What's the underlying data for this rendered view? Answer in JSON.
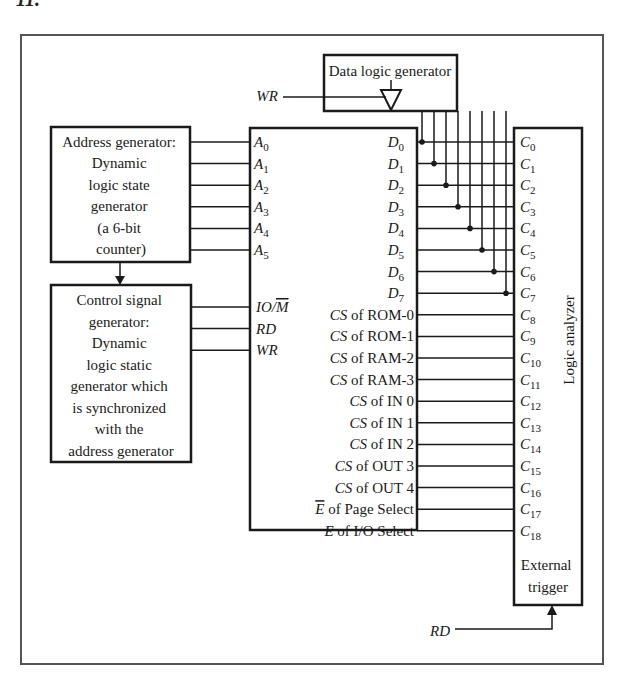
{
  "figure": {
    "label_fragment": "11.",
    "frame_color": "#555555",
    "line_color": "#1a1a1a"
  },
  "data_logic_generator": {
    "label": "Data logic generator",
    "enable_signal": "WR"
  },
  "address_generator": {
    "lines": [
      "Address generator:",
      "Dynamic",
      "logic state",
      "generator",
      "(a 6-bit",
      "counter)"
    ]
  },
  "control_signal_generator": {
    "lines": [
      "Control signal",
      "generator:",
      "Dynamic",
      "logic static",
      "generator which",
      "is synchronized",
      "with the",
      "address generator"
    ]
  },
  "central_block": {
    "address_inputs": [
      {
        "base": "A",
        "sub": "0"
      },
      {
        "base": "A",
        "sub": "1"
      },
      {
        "base": "A",
        "sub": "2"
      },
      {
        "base": "A",
        "sub": "3"
      },
      {
        "base": "A",
        "sub": "4"
      },
      {
        "base": "A",
        "sub": "5"
      }
    ],
    "control_inputs": [
      {
        "label": "IO/",
        "overbar": "M"
      },
      {
        "label": "RD",
        "overbar": ""
      },
      {
        "label": "WR",
        "overbar": ""
      }
    ],
    "data_outputs": [
      {
        "base": "D",
        "sub": "0"
      },
      {
        "base": "D",
        "sub": "1"
      },
      {
        "base": "D",
        "sub": "2"
      },
      {
        "base": "D",
        "sub": "3"
      },
      {
        "base": "D",
        "sub": "4"
      },
      {
        "base": "D",
        "sub": "5"
      },
      {
        "base": "D",
        "sub": "6"
      },
      {
        "base": "D",
        "sub": "7"
      }
    ],
    "select_outputs": [
      {
        "prefix": "CS",
        "prefix_overbar": false,
        "text": " of ROM-0"
      },
      {
        "prefix": "CS",
        "prefix_overbar": false,
        "text": " of ROM-1"
      },
      {
        "prefix": "CS",
        "prefix_overbar": false,
        "text": " of RAM-2"
      },
      {
        "prefix": "CS",
        "prefix_overbar": false,
        "text": " of RAM-3"
      },
      {
        "prefix": "CS",
        "prefix_overbar": false,
        "text": " of IN 0"
      },
      {
        "prefix": "CS",
        "prefix_overbar": false,
        "text": " of IN 1"
      },
      {
        "prefix": "CS",
        "prefix_overbar": false,
        "text": " of IN 2"
      },
      {
        "prefix": "CS",
        "prefix_overbar": false,
        "text": " of OUT 3"
      },
      {
        "prefix": "CS",
        "prefix_overbar": false,
        "text": " of OUT 4"
      },
      {
        "prefix": "E",
        "prefix_overbar": true,
        "text": " of Page Select"
      },
      {
        "prefix": "E",
        "prefix_overbar": false,
        "text": " of I/O Select"
      }
    ]
  },
  "logic_analyzer": {
    "title": "Logic analyzer",
    "channels": [
      {
        "base": "C",
        "sub": "0"
      },
      {
        "base": "C",
        "sub": "1"
      },
      {
        "base": "C",
        "sub": "2"
      },
      {
        "base": "C",
        "sub": "3"
      },
      {
        "base": "C",
        "sub": "4"
      },
      {
        "base": "C",
        "sub": "5"
      },
      {
        "base": "C",
        "sub": "6"
      },
      {
        "base": "C",
        "sub": "7"
      },
      {
        "base": "C",
        "sub": "8"
      },
      {
        "base": "C",
        "sub": "9"
      },
      {
        "base": "C",
        "sub": "10"
      },
      {
        "base": "C",
        "sub": "11"
      },
      {
        "base": "C",
        "sub": "12"
      },
      {
        "base": "C",
        "sub": "13"
      },
      {
        "base": "C",
        "sub": "14"
      },
      {
        "base": "C",
        "sub": "15"
      },
      {
        "base": "C",
        "sub": "16"
      },
      {
        "base": "C",
        "sub": "17"
      },
      {
        "base": "C",
        "sub": "18"
      }
    ],
    "trigger_lines": [
      "External",
      "trigger"
    ],
    "trigger_signal": "RD"
  }
}
